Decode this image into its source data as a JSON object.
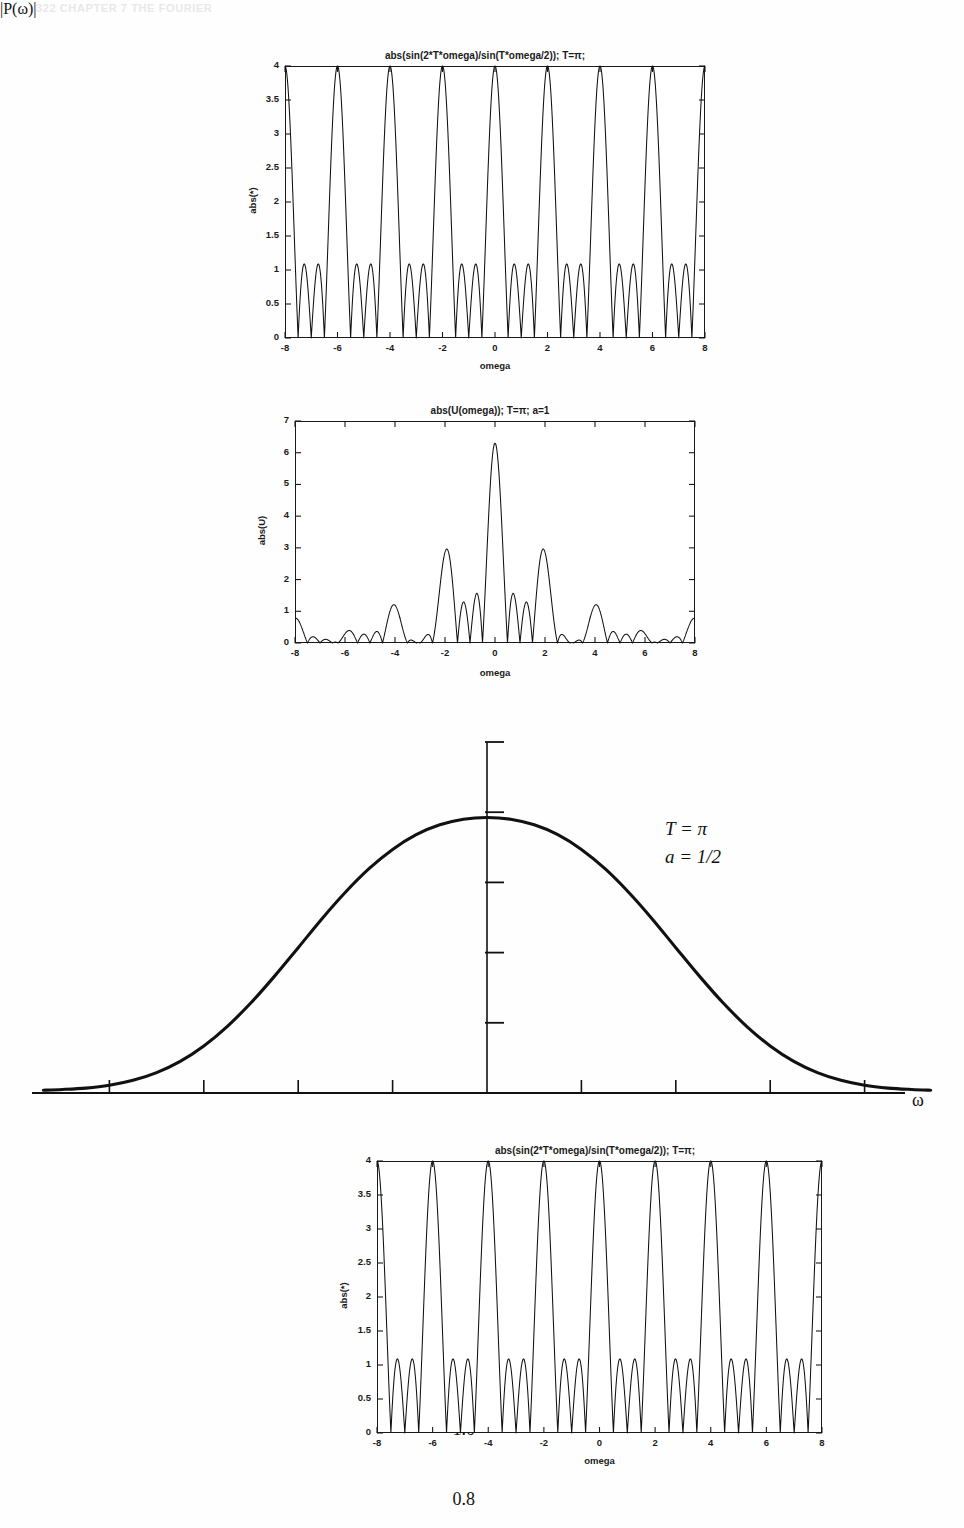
{
  "page": {
    "running_header": "322  CHAPTER 7  THE FOURIER"
  },
  "figures": {
    "top": {
      "title": "abs(sin(2*T*omega)/sin(T*omega/2)); T=π;",
      "ylabel": "abs(*)",
      "xlabel": "omega",
      "yticks": [
        "0",
        "0.5",
        "1",
        "1.5",
        "2",
        "2.5",
        "3",
        "3.5",
        "4"
      ],
      "xticks": [
        "-8",
        "-6",
        "-4",
        "-2",
        "0",
        "2",
        "4",
        "6",
        "8"
      ]
    },
    "second": {
      "title": "abs(U(omega)); T=π; a=1",
      "ylabel": "abs(U)",
      "xlabel": "omega",
      "yticks": [
        "0",
        "1",
        "2",
        "3",
        "4",
        "5",
        "6",
        "7"
      ],
      "xticks": [
        "-8",
        "-6",
        "-4",
        "-2",
        "0",
        "2",
        "4",
        "6",
        "8"
      ]
    },
    "main": {
      "ylabel": "|P(ω)|",
      "xlabel": "ω",
      "yticks": [
        "1.0",
        "0.8",
        "0.6",
        "0.4",
        "0.2"
      ],
      "xticks": [
        "-8",
        "-6",
        "-4",
        "-2",
        "0",
        "2",
        "4",
        "6",
        "8"
      ],
      "annotation_T": "T = π",
      "annotation_a": "a = 1/2"
    },
    "bottom": {
      "title": "abs(sin(2*T*omega)/sin(T*omega/2)); T=π;",
      "ylabel": "abs(*)",
      "xlabel": "omega",
      "yticks": [
        "0",
        "0.5",
        "1",
        "1.5",
        "2",
        "2.5",
        "3",
        "3.5",
        "4"
      ],
      "xticks": [
        "-8",
        "-6",
        "-4",
        "-2",
        "0",
        "2",
        "4",
        "6",
        "8"
      ]
    }
  },
  "chart_data": [
    {
      "id": "top",
      "type": "line",
      "title": "abs(sin(2*T*omega)/sin(T*omega/2)); T=π;",
      "xlabel": "omega",
      "ylabel": "abs(*)",
      "xlim": [
        -8,
        8
      ],
      "ylim": [
        0,
        4
      ],
      "xticks": [
        -8,
        -6,
        -4,
        -2,
        0,
        2,
        4,
        6,
        8
      ],
      "yticks": [
        0,
        0.5,
        1,
        1.5,
        2,
        2.5,
        3,
        3.5,
        4
      ],
      "grid": false,
      "legend": "none",
      "formula": "abs(sin(2*T*omega)/sin(T*omega/2)) with T=pi",
      "description": "Periodic Dirichlet-kernel magnitude; tall main lobes of height 4 at omega = 0, +/-2, +/-4, +/-6, +/-8 with two side lobes of height ~1.05 between consecutive main lobes, dropping to 0 at the nulls.",
      "peak_height": 4,
      "sidelobe_height": 1.05,
      "main_peak_positions": [
        -8,
        -6,
        -4,
        -2,
        0,
        2,
        4,
        6,
        8
      ],
      "period": 2
    },
    {
      "id": "second",
      "type": "line",
      "title": "abs(U(omega)); T=π; a=1",
      "xlabel": "omega",
      "ylabel": "abs(U)",
      "xlim": [
        -8,
        8
      ],
      "ylim": [
        0,
        7
      ],
      "xticks": [
        -8,
        -6,
        -4,
        -2,
        0,
        2,
        4,
        6,
        8
      ],
      "yticks": [
        0,
        1,
        2,
        3,
        4,
        5,
        6,
        7
      ],
      "grid": false,
      "legend": "none",
      "description": "Windowed spectrum magnitude: central peak of about 6.3 at omega = 0, secondary peaks near 2.6 at omega = -2 and +2, smaller lobes near 1.3 at omega = -1 and +1 and near 0.9 at omega = -1.4, +1.4, with very small ripples (below 0.25) outside |omega| > 2.6.",
      "peaks": [
        {
          "x": 0,
          "y": 6.3
        },
        {
          "x": -2.0,
          "y": 2.6
        },
        {
          "x": 2.0,
          "y": 2.6
        },
        {
          "x": -1.0,
          "y": 1.35
        },
        {
          "x": 1.0,
          "y": 1.35
        },
        {
          "x": -1.45,
          "y": 0.95
        },
        {
          "x": 1.45,
          "y": 0.95
        },
        {
          "x": -6.0,
          "y": 0.2
        },
        {
          "x": 6.0,
          "y": 0.2
        }
      ]
    },
    {
      "id": "main",
      "type": "line",
      "title": "",
      "xlabel": "ω",
      "ylabel": "|P(ω)|",
      "xlim": [
        -9.4,
        9.4
      ],
      "ylim": [
        0,
        1.0
      ],
      "xticks": [
        -8,
        -6,
        -4,
        -2,
        0,
        2,
        4,
        6,
        8
      ],
      "yticks": [
        0.2,
        0.4,
        0.6,
        0.8,
        1.0
      ],
      "grid": false,
      "legend": "none",
      "annotations": [
        "T = π",
        "a = 1/2"
      ],
      "description": "Smooth bell-shaped magnitude spectrum |P(omega)| peaking at about 0.785 at omega = 0 and decaying to nearly 0 by |omega| = 8.",
      "points": [
        {
          "x": -9.4,
          "y": 0.008
        },
        {
          "x": -9.0,
          "y": 0.01
        },
        {
          "x": -8.5,
          "y": 0.014
        },
        {
          "x": -8.0,
          "y": 0.022
        },
        {
          "x": -7.5,
          "y": 0.036
        },
        {
          "x": -7.0,
          "y": 0.058
        },
        {
          "x": -6.5,
          "y": 0.09
        },
        {
          "x": -6.0,
          "y": 0.134
        },
        {
          "x": -5.5,
          "y": 0.19
        },
        {
          "x": -5.0,
          "y": 0.257
        },
        {
          "x": -4.5,
          "y": 0.333
        },
        {
          "x": -4.0,
          "y": 0.414
        },
        {
          "x": -3.5,
          "y": 0.496
        },
        {
          "x": -3.0,
          "y": 0.572
        },
        {
          "x": -2.5,
          "y": 0.639
        },
        {
          "x": -2.0,
          "y": 0.694
        },
        {
          "x": -1.5,
          "y": 0.736
        },
        {
          "x": -1.0,
          "y": 0.764
        },
        {
          "x": -0.5,
          "y": 0.78
        },
        {
          "x": 0.0,
          "y": 0.785
        },
        {
          "x": 0.5,
          "y": 0.78
        },
        {
          "x": 1.0,
          "y": 0.764
        },
        {
          "x": 1.5,
          "y": 0.736
        },
        {
          "x": 2.0,
          "y": 0.694
        },
        {
          "x": 2.5,
          "y": 0.639
        },
        {
          "x": 3.0,
          "y": 0.572
        },
        {
          "x": 3.5,
          "y": 0.496
        },
        {
          "x": 4.0,
          "y": 0.414
        },
        {
          "x": 4.5,
          "y": 0.333
        },
        {
          "x": 5.0,
          "y": 0.257
        },
        {
          "x": 5.5,
          "y": 0.19
        },
        {
          "x": 6.0,
          "y": 0.134
        },
        {
          "x": 6.5,
          "y": 0.09
        },
        {
          "x": 7.0,
          "y": 0.058
        },
        {
          "x": 7.5,
          "y": 0.036
        },
        {
          "x": 8.0,
          "y": 0.022
        },
        {
          "x": 8.5,
          "y": 0.014
        },
        {
          "x": 9.0,
          "y": 0.01
        },
        {
          "x": 9.4,
          "y": 0.008
        }
      ],
      "peak_value": 0.785,
      "peak_position": 0
    },
    {
      "id": "bottom",
      "type": "line",
      "title": "abs(sin(2*T*omega)/sin(T*omega/2)); T=π;",
      "xlabel": "omega",
      "ylabel": "abs(*)",
      "xlim": [
        -8,
        8
      ],
      "ylim": [
        0,
        4
      ],
      "xticks": [
        -8,
        -6,
        -4,
        -2,
        0,
        2,
        4,
        6,
        8
      ],
      "yticks": [
        0,
        0.5,
        1,
        1.5,
        2,
        2.5,
        3,
        3.5,
        4
      ],
      "grid": false,
      "legend": "none",
      "formula": "abs(sin(2*T*omega)/sin(T*omega/2)) with T=pi",
      "description": "Same periodic Dirichlet-kernel magnitude as the top panel; main lobes of height 4 at even integer omega with two side lobes of height ~1.05 between them.",
      "peak_height": 4,
      "sidelobe_height": 1.05,
      "main_peak_positions": [
        -8,
        -6,
        -4,
        -2,
        0,
        2,
        4,
        6,
        8
      ],
      "period": 2
    }
  ]
}
